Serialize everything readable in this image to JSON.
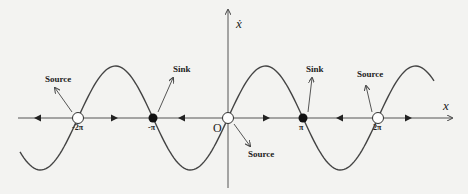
{
  "diagram": {
    "type": "phase-line",
    "function": "x_dot = sin(x)",
    "axes": {
      "x_label": "x",
      "y_label": "ẋ",
      "origin_label": "O"
    },
    "ticks": [
      "-2π",
      "-π",
      "π",
      "2π"
    ],
    "fixed_points": [
      {
        "x": "-2π",
        "type": "open",
        "label": "Source"
      },
      {
        "x": "-π",
        "type": "filled",
        "label": "Sink"
      },
      {
        "x": "0",
        "type": "open",
        "label": "Source"
      },
      {
        "x": "π",
        "type": "filled",
        "label": "Sink"
      },
      {
        "x": "2π",
        "type": "open",
        "label": "Source"
      }
    ],
    "annotations": {
      "source_left": "Source",
      "sink_left": "Sink",
      "source_origin": "Source",
      "sink_right": "Sink",
      "source_right": "Source"
    },
    "colors": {
      "line": "#333333",
      "background": "#f3f3f1"
    }
  }
}
